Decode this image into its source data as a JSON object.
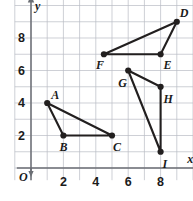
{
  "chart_data": {
    "type": "scatter",
    "title": "",
    "xlabel": "x",
    "ylabel": "y",
    "origin_label": "O",
    "grid": true,
    "xlim": [
      0,
      10
    ],
    "ylim": [
      0,
      10
    ],
    "xticks": [
      2,
      4,
      6,
      8
    ],
    "yticks": [
      2,
      4,
      6,
      8
    ],
    "xtick_labels": [
      "2",
      "4",
      "6",
      "8"
    ],
    "ytick_labels": [
      "2",
      "4",
      "6",
      "8"
    ],
    "grid_step": 1,
    "points": [
      {
        "label": "A",
        "x": 1,
        "y": 4,
        "label_dx": 4,
        "label_dy": -14
      },
      {
        "label": "B",
        "x": 2,
        "y": 2,
        "label_dx": -4,
        "label_dy": 5
      },
      {
        "label": "C",
        "x": 5,
        "y": 2,
        "label_dx": 1,
        "label_dy": 5
      },
      {
        "label": "D",
        "x": 9,
        "y": 9,
        "label_dx": 3,
        "label_dy": -15
      },
      {
        "label": "E",
        "x": 8,
        "y": 7,
        "label_dx": 3,
        "label_dy": 5
      },
      {
        "label": "F",
        "x": 4.5,
        "y": 7,
        "label_dx": -8,
        "label_dy": 5
      },
      {
        "label": "G",
        "x": 6,
        "y": 6,
        "label_dx": -10,
        "label_dy": 6
      },
      {
        "label": "H",
        "x": 8,
        "y": 5,
        "label_dx": 3,
        "label_dy": 6
      },
      {
        "label": "I",
        "x": 8,
        "y": 1,
        "label_dx": 2,
        "label_dy": 6
      }
    ],
    "triangles": [
      {
        "name": "triangle-abc",
        "vertices": [
          "A",
          "B",
          "C"
        ]
      },
      {
        "name": "triangle-def",
        "vertices": [
          "D",
          "E",
          "F"
        ]
      },
      {
        "name": "triangle-ghi",
        "vertices": [
          "G",
          "H",
          "I"
        ]
      }
    ],
    "colors": {
      "grid": "#b9bcc4",
      "axis": "#6b6e74",
      "stroke": "#221f1f",
      "background": "#ffffff",
      "text": "#1b1b1b"
    }
  }
}
